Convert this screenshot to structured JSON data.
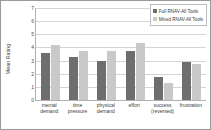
{
  "chart_data": {
    "type": "bar",
    "title": "",
    "xlabel": "",
    "ylabel": "Mean Rating",
    "ylim": [
      0,
      7
    ],
    "yticks": [
      0,
      1,
      2,
      3,
      4,
      5,
      6,
      7
    ],
    "grid": true,
    "legend_position": "top-right",
    "categories": [
      "mental demand",
      "time pressure",
      "physical demand",
      "effort",
      "success (reversed)",
      "frustration"
    ],
    "category_lines": [
      [
        "mental",
        "demand"
      ],
      [
        "time",
        "pressure"
      ],
      [
        "physical",
        "demand"
      ],
      [
        "effort",
        ""
      ],
      [
        "success",
        "(reversed)"
      ],
      [
        "frustration",
        ""
      ]
    ],
    "series": [
      {
        "name": "Full RNAV-All Tools",
        "color": "#6e6e6e",
        "values": [
          3.6,
          3.3,
          3.0,
          3.75,
          1.75,
          2.9
        ]
      },
      {
        "name": "Mixed RNAV-All Tools",
        "color": "#c9c9c9",
        "values": [
          4.2,
          3.75,
          3.75,
          4.35,
          1.3,
          2.75
        ]
      }
    ]
  }
}
